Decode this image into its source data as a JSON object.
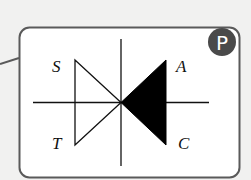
{
  "diagram": {
    "type": "triac-like symbol card",
    "badge": {
      "label": "P",
      "color": "#4a4a4a"
    },
    "labels": {
      "top_left": "S",
      "bottom_left": "T",
      "top_right": "A",
      "bottom_right": "C"
    },
    "colors": {
      "background": "#f1f1f0",
      "card_fill": "#ffffff",
      "card_border": "#5a5a5a",
      "line": "#111111",
      "filled_triangle": "#000000"
    }
  }
}
